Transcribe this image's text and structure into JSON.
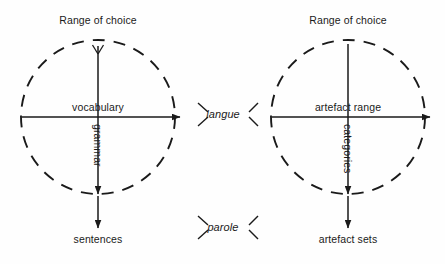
{
  "figure": {
    "background_color": "#fefefe",
    "stroke_color": "#1a1a1a",
    "panels": [
      {
        "id": "language",
        "heading": "Range of choice",
        "horizontal_axis_label": "vocabulary",
        "vertical_axis_label": "grammar",
        "output_label": "sentences",
        "has_branch_fork": true,
        "circle": {
          "cx": 98,
          "cy": 117,
          "r": 77,
          "dashed": true
        }
      },
      {
        "id": "artefact",
        "heading": "Range of choice",
        "horizontal_axis_label": "artefact range",
        "vertical_axis_label": "categories",
        "output_label": "artefact sets",
        "has_branch_fork": false,
        "circle": {
          "cx": 348,
          "cy": 117,
          "r": 77,
          "dashed": true
        }
      }
    ],
    "center_labels": [
      {
        "text": "langue",
        "italic": true,
        "x": 223,
        "y": 115
      },
      {
        "text": "parole",
        "italic": true,
        "x": 223,
        "y": 228
      }
    ]
  }
}
